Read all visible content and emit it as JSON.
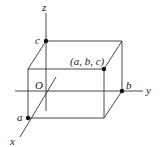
{
  "diagram": {
    "axes": {
      "x_label": "x",
      "y_label": "y",
      "z_label": "z",
      "origin_label": "O"
    },
    "points": {
      "a_label": "a",
      "b_label": "b",
      "c_label": "c",
      "corner_label": "(a, b, c)"
    },
    "colors": {
      "line": "#333333",
      "point": "#111111",
      "background": "#ffffff"
    }
  }
}
